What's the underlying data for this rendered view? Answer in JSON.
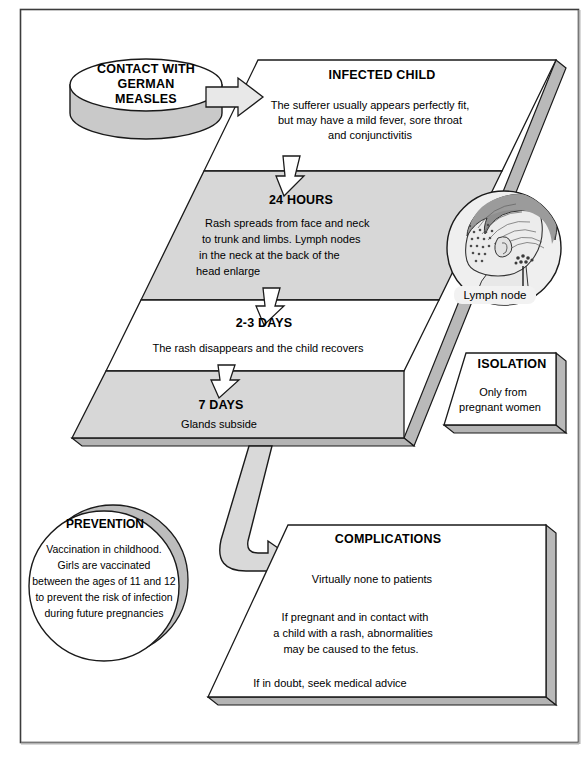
{
  "meta": {
    "colors": {
      "slab_face_light": "#ffffff",
      "slab_face_shaded": "#d7d7d7",
      "slab_edge": "#a8a8a8",
      "slab_edge_dark": "#9a9a9a",
      "outline": "#1a1a1a",
      "arrow_fill": "#e3e3e3",
      "arrow_white": "#ffffff",
      "frame": "#3c3c3c",
      "hair": "#8c8c8c",
      "skin": "#e8e8e8"
    }
  },
  "start_node": {
    "label_lines": [
      "CONTACT WITH",
      "GERMAN",
      "MEASLES"
    ],
    "shape": "ellipse-cylinder"
  },
  "arrows": {
    "contact_to_child": "arrow-right",
    "child_to_24h": "arrow-down",
    "h24_to_23days": "arrow-down",
    "d23_to_7days": "arrow-down",
    "slab_to_complications": "arrow-curved-down-right"
  },
  "stages": [
    {
      "id": "infected-child",
      "heading": "INFECTED CHILD",
      "body_lines": [
        "The sufferer usually appears perfectly fit,",
        "but may have a mild fever, sore throat",
        "and conjunctivitis"
      ],
      "shaded": false
    },
    {
      "id": "24-hours",
      "heading": "24 HOURS",
      "body_lines": [
        "Rash spreads from face and neck",
        "to trunk and limbs. Lymph nodes",
        "in the neck at the back of the",
        "head enlarge"
      ],
      "shaded": true
    },
    {
      "id": "2-3-days",
      "heading": "2-3 DAYS",
      "body_lines": [
        "The rash disappears and the child recovers"
      ],
      "shaded": false
    },
    {
      "id": "7-days",
      "heading": "7 DAYS",
      "body_lines": [
        "Glands subside"
      ],
      "shaded": true
    }
  ],
  "inset_illustration": {
    "id": "child-head",
    "caption": "Lymph node",
    "description": "child head profile with rash and enlarged lymph node"
  },
  "isolation_panel": {
    "heading": "ISOLATION",
    "body_lines": [
      "Only from",
      "pregnant women"
    ]
  },
  "prevention_node": {
    "heading": "PREVENTION",
    "body_lines": [
      "Vaccination in childhood.",
      "Girls are vaccinated",
      "between the ages of 11 and 12",
      "to prevent the risk of infection",
      "during future pregnancies"
    ]
  },
  "complications_panel": {
    "heading": "COMPLICATIONS",
    "paragraphs": [
      [
        "Virtually none to patients"
      ],
      [
        "If pregnant and in contact with",
        "a child with a rash, abnormalities",
        "may be caused to the fetus."
      ],
      [
        "If in doubt, seek medical advice"
      ]
    ]
  }
}
